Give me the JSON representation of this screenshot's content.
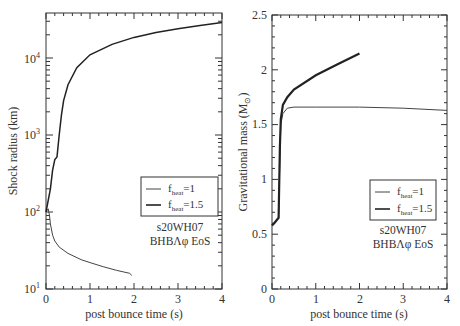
{
  "chart_data": [
    {
      "type": "line",
      "panel": "left",
      "title": "",
      "xlabel": "post bounce time (s)",
      "ylabel": "Shock radius (km)",
      "xlim": [
        0,
        4
      ],
      "ylim": [
        10,
        40000
      ],
      "yscale": "log",
      "x_ticks": [
        "0",
        "1",
        "2",
        "3",
        "4"
      ],
      "y_ticks": [
        "10^1",
        "10^2",
        "10^3",
        "10^4"
      ],
      "grid": false,
      "legend": {
        "position": "right-middle",
        "entries": [
          "f_heat=1",
          "f_heat=1.5"
        ]
      },
      "annotation": [
        "s20WH07",
        "BHBΛφ EoS"
      ],
      "series": [
        {
          "name": "f_heat=1",
          "x": [
            0.0,
            0.05,
            0.08,
            0.1,
            0.15,
            0.2,
            0.3,
            0.5,
            0.8,
            1.0,
            1.3,
            1.6,
            1.9,
            1.95
          ],
          "y": [
            100,
            110,
            90,
            70,
            50,
            42,
            35,
            29,
            24,
            22,
            19.5,
            17.5,
            16,
            15
          ]
        },
        {
          "name": "f_heat=1.5",
          "x": [
            0.0,
            0.1,
            0.15,
            0.2,
            0.25,
            0.3,
            0.35,
            0.4,
            0.5,
            0.7,
            1.0,
            1.5,
            2.0,
            2.5,
            3.0,
            3.5,
            4.0
          ],
          "y": [
            100,
            200,
            350,
            480,
            520,
            1000,
            1800,
            2800,
            4500,
            7500,
            11000,
            15000,
            18500,
            21500,
            24000,
            26500,
            29000
          ]
        }
      ]
    },
    {
      "type": "line",
      "panel": "right",
      "title": "",
      "xlabel": "post bounce time (s)",
      "ylabel": "Gravitational mass (M_⊙)",
      "xlim": [
        0,
        4
      ],
      "ylim": [
        0,
        2.5
      ],
      "x_ticks": [
        "0",
        "1",
        "2",
        "3",
        "4"
      ],
      "y_ticks": [
        "0",
        "0.5",
        "1",
        "1.5",
        "2",
        "2.5"
      ],
      "grid": false,
      "legend": {
        "position": "right-middle",
        "entries": [
          "f_heat=1",
          "f_heat=1.5"
        ]
      },
      "annotation": [
        "s20WH07",
        "BHBΛφ EoS"
      ],
      "series": [
        {
          "name": "f_heat=1",
          "x": [
            0.0,
            0.05,
            0.15,
            0.18,
            0.2,
            0.25,
            0.35,
            0.5,
            1.0,
            2.0,
            3.0,
            4.0
          ],
          "y": [
            0.58,
            0.6,
            0.65,
            1.2,
            1.5,
            1.6,
            1.65,
            1.66,
            1.66,
            1.66,
            1.65,
            1.63
          ]
        },
        {
          "name": "f_heat=1.5",
          "x": [
            0.0,
            0.05,
            0.15,
            0.18,
            0.2,
            0.25,
            0.35,
            0.5,
            1.0,
            1.5,
            2.0
          ],
          "y": [
            0.58,
            0.6,
            0.65,
            1.3,
            1.55,
            1.68,
            1.75,
            1.82,
            1.95,
            2.05,
            2.15
          ]
        }
      ]
    }
  ],
  "labels": {
    "left": {
      "ylabel": "Shock radius (km)",
      "xlabel": "post bounce time (s)",
      "xticks": [
        "0",
        "1",
        "2",
        "3",
        "4"
      ],
      "ytick_base": "10",
      "ytick_exps": [
        "1",
        "2",
        "3",
        "4"
      ],
      "legend_1_prefix": "f",
      "legend_1_sub": "heat",
      "legend_1_suffix": "=1",
      "legend_2_prefix": "f",
      "legend_2_sub": "heat",
      "legend_2_suffix": "=1.5",
      "annotation_1": "s20WH07",
      "annotation_2": "BHBΛφ EoS"
    },
    "right": {
      "ylabel_main": "Gravitational mass (M",
      "ylabel_sub": "⊙",
      "ylabel_end": ")",
      "xlabel": "post bounce time (s)",
      "xticks": [
        "0",
        "1",
        "2",
        "3",
        "4"
      ],
      "yticks": [
        "0",
        "0.5",
        "1",
        "1.5",
        "2",
        "2.5"
      ],
      "legend_1_prefix": "f",
      "legend_1_sub": "heat",
      "legend_1_suffix": "=1",
      "legend_2_prefix": "f",
      "legend_2_sub": "heat",
      "legend_2_suffix": "=1.5",
      "annotation_1": "s20WH07",
      "annotation_2": "BHBΛφ EoS"
    }
  },
  "colors": {
    "axis": "#333333",
    "series_1": "#444444",
    "series_2": "#222222"
  }
}
